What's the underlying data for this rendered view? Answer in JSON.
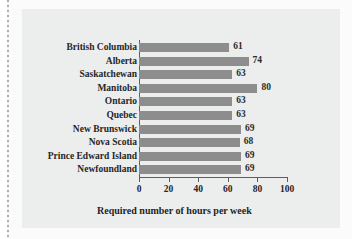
{
  "chart_data": {
    "type": "bar",
    "orientation": "horizontal",
    "title": "",
    "xlabel": "Required number of hours per week",
    "ylabel": "",
    "xlim": [
      0,
      100
    ],
    "xticks": [
      0,
      20,
      40,
      60,
      80,
      100
    ],
    "grid": false,
    "legend": null,
    "bar_color": "#8d8d8d",
    "background_color": "#eceded",
    "categories": [
      "British Columbia",
      "Alberta",
      "Saskatchewan",
      "Manitoba",
      "Ontario",
      "Quebec",
      "New Brunswick",
      "Nova Scotia",
      "Prince Edward Island",
      "Newfoundland"
    ],
    "values": [
      61,
      74,
      63,
      80,
      63,
      63,
      69,
      68,
      69,
      69
    ],
    "data_labels": [
      "61",
      "74",
      "63",
      "80",
      "63",
      "63",
      "69",
      "68",
      "69",
      "69"
    ],
    "tick_labels": [
      "0",
      "20",
      "40",
      "60",
      "80",
      "100"
    ]
  }
}
